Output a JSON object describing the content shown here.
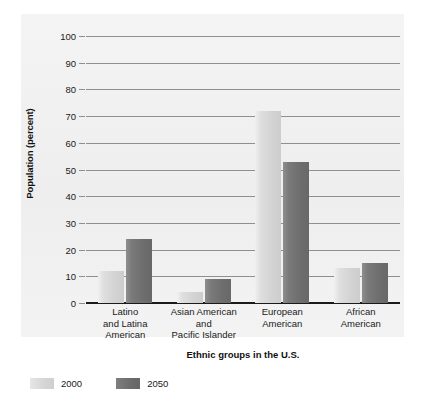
{
  "chart_data": {
    "type": "bar",
    "title": "",
    "xlabel": "Ethnic groups in the U.S.",
    "ylabel": "Population (percent)",
    "categories": [
      "Latino\nand Latina\nAmerican",
      "Asian American\nand\nPacific Islander",
      "European\nAmerican",
      "African\nAmerican"
    ],
    "series": [
      {
        "name": "2000",
        "color": "#d5d5d5",
        "values": [
          12,
          4,
          72,
          13
        ]
      },
      {
        "name": "2050",
        "color": "#6e6e6e",
        "values": [
          24,
          9,
          53,
          15
        ]
      }
    ],
    "ylim": [
      0,
      100
    ],
    "yticks": [
      0,
      10,
      20,
      30,
      40,
      50,
      60,
      70,
      80,
      90,
      100
    ],
    "ytick_labels": [
      "0",
      "10",
      "20",
      "30",
      "40",
      "50",
      "60",
      "70",
      "80",
      "90",
      "100"
    ],
    "grid": true,
    "legend_position": "bottom-left"
  },
  "legend": {
    "items": [
      {
        "label": "2000",
        "swatch": "s2000"
      },
      {
        "label": "2050",
        "swatch": "s2050"
      }
    ]
  },
  "colors": {
    "panel_background": "#f2f2f2",
    "gridline": "#8f8f8f",
    "axis": "#1a1a1a",
    "series_2000": "#d5d5d5",
    "series_2050": "#6e6e6e",
    "text": "#1a1a1a"
  }
}
